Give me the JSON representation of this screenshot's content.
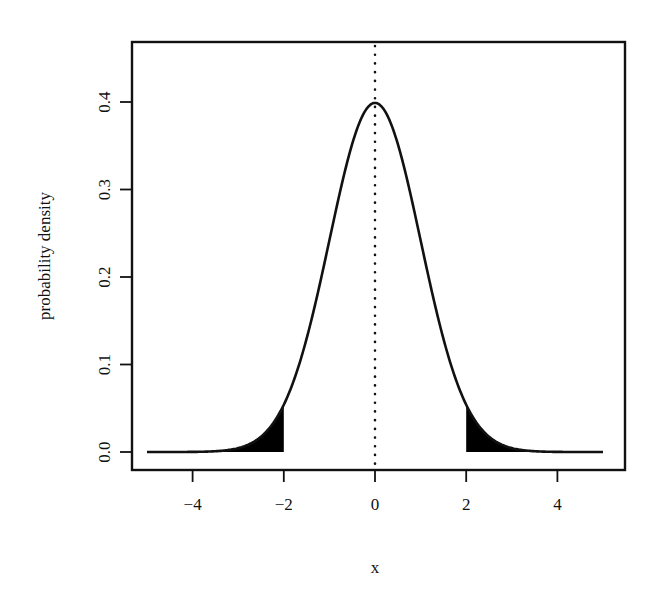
{
  "chart_data": {
    "type": "line",
    "title": "",
    "xlabel": "x",
    "ylabel": "probability density",
    "xlim": [
      -5.3,
      5.5
    ],
    "ylim": [
      -0.021,
      0.468
    ],
    "x_ticks": [
      -4,
      -2,
      0,
      2,
      4
    ],
    "x_tick_labels": [
      "−4",
      "−2",
      "0",
      "2",
      "4"
    ],
    "y_ticks": [
      0.0,
      0.1,
      0.2,
      0.3,
      0.4
    ],
    "y_tick_labels": [
      "0.0",
      "0.1",
      "0.2",
      "0.3",
      "0.4"
    ],
    "grid": false,
    "legend": null,
    "series": [
      {
        "name": "standard normal density",
        "distribution": "normal",
        "mean": 0,
        "sd": 1,
        "x_range": [
          -5,
          5
        ],
        "x": [
          -5,
          -4,
          -3,
          -2.5,
          -2,
          -1.5,
          -1,
          -0.5,
          0,
          0.5,
          1,
          1.5,
          2,
          2.5,
          3,
          4,
          5
        ],
        "y": [
          0.0,
          0.0001,
          0.0044,
          0.0175,
          0.054,
          0.1295,
          0.242,
          0.3521,
          0.3989,
          0.3521,
          0.242,
          0.1295,
          0.054,
          0.0175,
          0.0044,
          0.0001,
          0.0
        ],
        "line_style": "solid",
        "color": "#111111"
      }
    ],
    "annotations": [
      {
        "type": "vline",
        "x": 0,
        "line_style": "dotted",
        "color": "#111111"
      },
      {
        "type": "shaded_area",
        "from": -5,
        "to": -2,
        "label": "left tail",
        "color": "#000000"
      },
      {
        "type": "shaded_area",
        "from": 2,
        "to": 5,
        "label": "right tail",
        "color": "#000000"
      }
    ]
  },
  "layout": {
    "plot_box": {
      "left": 132,
      "top": 42,
      "right": 625,
      "bottom": 470
    },
    "x_axis": {
      "px_at_zero": 375,
      "px_per_unit": 45.6
    },
    "y_axis": {
      "px_at_zero": 452,
      "px_per_unit": 875
    }
  }
}
